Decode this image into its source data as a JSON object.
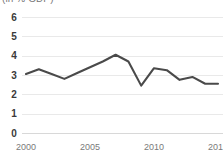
{
  "chart_data": {
    "type": "line",
    "title": "",
    "subtitle": "",
    "unit_label": "(in % GDP)",
    "xlabel": "",
    "ylabel": "",
    "xlim": [
      2000,
      2015
    ],
    "ylim": [
      0,
      6
    ],
    "grid": true,
    "legend_position": "none",
    "line_color": "#4a4a4a",
    "grid_color": "#e9e9e9",
    "x": [
      2000,
      2001,
      2002,
      2003,
      2004,
      2005,
      2006,
      2007,
      2008,
      2009,
      2010,
      2011,
      2012,
      2013,
      2014,
      2015
    ],
    "series": [
      {
        "name": "value",
        "values": [
          3.05,
          3.3,
          3.05,
          2.8,
          3.1,
          3.4,
          3.7,
          4.05,
          3.7,
          2.45,
          3.35,
          3.25,
          2.75,
          2.9,
          2.55,
          2.55
        ]
      }
    ],
    "ytick_labels": [
      "6",
      "5",
      "4",
      "3",
      "2",
      "1",
      "0"
    ],
    "ytick_values": [
      6,
      5,
      4,
      3,
      2,
      1,
      0
    ],
    "xtick_labels": [
      "2000",
      "2005",
      "2010",
      "2015"
    ],
    "xtick_values": [
      2000,
      2005,
      2010,
      2015
    ]
  }
}
